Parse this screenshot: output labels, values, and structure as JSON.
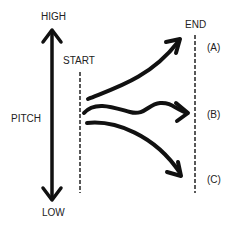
{
  "diagram": {
    "axis": {
      "high_label": "HIGH",
      "low_label": "LOW",
      "axis_label": "PITCH"
    },
    "markers": {
      "start_label": "START",
      "end_label": "END"
    },
    "outcomes": [
      {
        "label": "(A)",
        "direction": "rising"
      },
      {
        "label": "(B)",
        "direction": "level"
      },
      {
        "label": "(C)",
        "direction": "falling"
      }
    ],
    "colors": {
      "ink": "#111111",
      "text": "#222222",
      "background": "#ffffff"
    }
  }
}
